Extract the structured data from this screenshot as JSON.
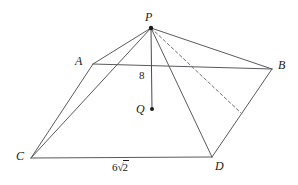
{
  "figure": {
    "type": "geometry-diagram",
    "background_color": "#ffffff",
    "line_color": "#5a5a5e",
    "label_color": "#1a1a1a"
  },
  "labels": {
    "apex": "P",
    "vertex_a": "A",
    "vertex_b": "B",
    "vertex_c": "C",
    "vertex_d": "D",
    "center": "Q",
    "height": "8",
    "base_edge_coefficient": "6",
    "base_edge_radical_sign": "√",
    "base_edge_radicand": "2"
  },
  "points": {
    "P": {
      "x": 151,
      "y": 28
    },
    "A": {
      "x": 93,
      "y": 64
    },
    "B": {
      "x": 272,
      "y": 69
    },
    "C": {
      "x": 31,
      "y": 158
    },
    "D": {
      "x": 212,
      "y": 157
    },
    "E": {
      "x": 241,
      "y": 113
    },
    "Q": {
      "x": 152,
      "y": 109
    }
  },
  "edges": [
    {
      "name": "P-A",
      "from": "P",
      "to": "A",
      "style": "solid"
    },
    {
      "name": "P-B",
      "from": "P",
      "to": "B",
      "style": "solid"
    },
    {
      "name": "P-C",
      "from": "P",
      "to": "C",
      "style": "solid"
    },
    {
      "name": "P-D",
      "from": "P",
      "to": "D",
      "style": "solid"
    },
    {
      "name": "P-E",
      "from": "P",
      "to": "E",
      "style": "dashed"
    },
    {
      "name": "A-B",
      "from": "A",
      "to": "B",
      "style": "solid"
    },
    {
      "name": "A-C",
      "from": "A",
      "to": "C",
      "style": "solid"
    },
    {
      "name": "C-D",
      "from": "C",
      "to": "D",
      "style": "solid"
    },
    {
      "name": "B-D",
      "from": "B",
      "to": "D",
      "style": "solid"
    },
    {
      "name": "P-Q",
      "from": "P",
      "to": "Q",
      "style": "solid-altitude"
    }
  ],
  "dots": [
    {
      "name": "apex-dot",
      "at": "P",
      "r": 2.2
    },
    {
      "name": "center-dot",
      "at": "Q",
      "r": 2.0
    }
  ]
}
